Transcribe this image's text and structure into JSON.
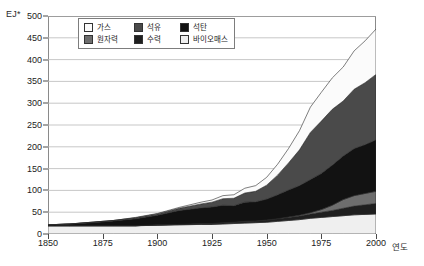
{
  "chart_data": {
    "type": "area",
    "title": "",
    "subtitle": "",
    "xlabel": "연도",
    "ylabel": "EJ*",
    "stacked": true,
    "grid": true,
    "legend_position": "top-left-inside",
    "xlim": [
      1850,
      2000
    ],
    "ylim": [
      0,
      500
    ],
    "x_ticks": [
      1850,
      1875,
      1900,
      1925,
      1950,
      1975,
      2000
    ],
    "y_ticks": [
      0,
      50,
      100,
      150,
      200,
      250,
      300,
      350,
      400,
      450,
      500
    ],
    "x": [
      1850,
      1860,
      1870,
      1880,
      1890,
      1900,
      1910,
      1920,
      1925,
      1930,
      1935,
      1940,
      1945,
      1950,
      1955,
      1960,
      1965,
      1970,
      1975,
      1980,
      1985,
      1990,
      1995,
      2000
    ],
    "series": [
      {
        "name": "바이오매스",
        "key": "biomass",
        "color": "#efefef",
        "order": 1,
        "values": [
          19,
          19,
          19,
          19,
          19,
          20,
          21,
          22,
          22,
          23,
          24,
          25,
          26,
          27,
          29,
          31,
          33,
          36,
          38,
          40,
          42,
          44,
          45,
          46
        ]
      },
      {
        "name": "수력",
        "key": "hydro",
        "color": "#1f1f1f",
        "order": 2,
        "values": [
          0,
          0,
          0,
          0,
          0,
          1,
          1,
          2,
          2,
          3,
          3,
          4,
          4,
          5,
          6,
          7,
          8,
          10,
          12,
          14,
          17,
          20,
          22,
          24
        ]
      },
      {
        "name": "원자력",
        "key": "nuclear",
        "color": "#6e6e6e",
        "order": 3,
        "values": [
          0,
          0,
          0,
          0,
          0,
          0,
          0,
          0,
          0,
          0,
          0,
          0,
          0,
          0,
          0,
          1,
          2,
          3,
          6,
          12,
          20,
          24,
          26,
          28
        ]
      },
      {
        "name": "석탄",
        "key": "coal",
        "color": "#121212",
        "order": 4,
        "values": [
          2,
          4,
          7,
          11,
          16,
          22,
          32,
          36,
          38,
          40,
          38,
          44,
          44,
          48,
          55,
          62,
          68,
          76,
          83,
          92,
          100,
          108,
          112,
          118
        ]
      },
      {
        "name": "석유",
        "key": "oil",
        "color": "#4a4a4a",
        "order": 5,
        "values": [
          0,
          0,
          1,
          1,
          2,
          3,
          5,
          9,
          11,
          15,
          17,
          21,
          24,
          32,
          45,
          62,
          82,
          108,
          120,
          128,
          126,
          136,
          142,
          150
        ]
      },
      {
        "name": "가스",
        "key": "gas",
        "color": "#fbfbfb",
        "order": 6,
        "values": [
          0,
          0,
          0,
          0,
          1,
          1,
          2,
          4,
          5,
          7,
          8,
          11,
          13,
          18,
          25,
          33,
          44,
          58,
          66,
          72,
          78,
          88,
          96,
          104
        ]
      }
    ],
    "totals_note": "Stacked total reaches approximately 470 EJ at 2000",
    "legend_entries": [
      {
        "label": "가스",
        "color": "#fbfbfb"
      },
      {
        "label": "석유",
        "color": "#4a4a4a"
      },
      {
        "label": "석탄",
        "color": "#121212"
      },
      {
        "label": "원자력",
        "color": "#6e6e6e"
      },
      {
        "label": "수력",
        "color": "#1f1f1f"
      },
      {
        "label": "바이오매스",
        "color": "#efefef"
      }
    ]
  },
  "axes": {
    "unit_label": "EJ*",
    "x_title": "연도",
    "y_tick_labels": [
      "500",
      "450",
      "400",
      "350",
      "300",
      "250",
      "200",
      "150",
      "100",
      "50",
      "0"
    ],
    "x_tick_labels": [
      "1850",
      "1875",
      "1900",
      "1925",
      "1950",
      "1975",
      "2000"
    ]
  },
  "style": {
    "frame_color": "#8a8a8a",
    "grid_color": "#b9b9b9",
    "text_color": "#1a1a1a",
    "background": "#ffffff"
  }
}
